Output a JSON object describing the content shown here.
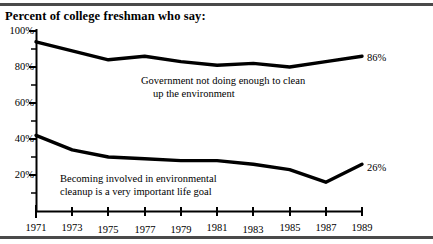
{
  "chart_data": {
    "type": "line",
    "title": "Percent of college freshman who say:",
    "xlabel": "",
    "ylabel": "",
    "ylim": [
      0,
      100
    ],
    "ytick_labels": [
      "100%",
      "80%",
      "60%",
      "40%",
      "20%"
    ],
    "ytick_values": [
      100,
      80,
      60,
      40,
      20
    ],
    "yminor_values": [
      90,
      70,
      50,
      30,
      10,
      0
    ],
    "grid": false,
    "legend": "annotations-inline",
    "x": [
      1971,
      1973,
      1975,
      1977,
      1979,
      1981,
      1983,
      1985,
      1987,
      1989
    ],
    "xtick_labels": [
      "1971",
      "1973",
      "1975",
      "1977",
      "1979",
      "1981",
      "1983",
      "1985",
      "1987",
      "1989"
    ],
    "series": [
      {
        "name": "Government not doing enough to clean up the environment",
        "values": [
          94,
          89,
          84,
          86,
          83,
          81,
          82,
          80,
          83,
          86
        ],
        "end_label": "86%",
        "annotation_line1": "Government not doing enough to clean",
        "annotation_line2": "up the environment"
      },
      {
        "name": "Becoming involved in environmental cleanup is a very important life goal",
        "values": [
          42,
          34,
          30,
          29,
          28,
          28,
          26,
          23,
          16,
          26
        ],
        "end_label": "26%",
        "annotation_line1": "Becoming involved in environmental",
        "annotation_line2": "cleanup is a very important life goal"
      }
    ],
    "colors": {
      "line": "#000000",
      "axis": "#000000",
      "rule": "#4a4a4a",
      "background": "#ffffff"
    }
  }
}
